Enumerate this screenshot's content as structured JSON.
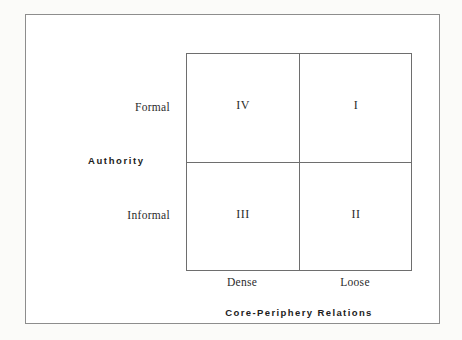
{
  "chart_data": {
    "type": "table",
    "title": "",
    "xlabel": "Core-Periphery Relations",
    "ylabel": "Authority",
    "x_categories": [
      "Dense",
      "Loose"
    ],
    "y_categories": [
      "Formal",
      "Informal"
    ],
    "grid": true,
    "legend": "none",
    "cells": [
      {
        "row": "Formal",
        "column": "Dense",
        "value": "IV"
      },
      {
        "row": "Formal",
        "column": "Loose",
        "value": "I"
      },
      {
        "row": "Informal",
        "column": "Dense",
        "value": "III"
      },
      {
        "row": "Informal",
        "column": "Loose",
        "value": "II"
      }
    ]
  },
  "axes": {
    "y": {
      "title": "Authority",
      "ticks": [
        {
          "label": "Formal"
        },
        {
          "label": "Informal"
        }
      ]
    },
    "x": {
      "title": "Core-Periphery Relations",
      "ticks": [
        {
          "label": "Dense"
        },
        {
          "label": "Loose"
        }
      ]
    }
  },
  "quadrants": {
    "top_left": "IV",
    "top_right": "I",
    "bottom_left": "III",
    "bottom_right": "II"
  },
  "colors": {
    "page_background": "#fbfbf9",
    "frame_background": "#ffffff",
    "frame_border": "#8d8d8d",
    "matrix_line": "#6e6e6e",
    "serif_text": "#2b2b2b",
    "bold_text": "#1c1c1c"
  }
}
